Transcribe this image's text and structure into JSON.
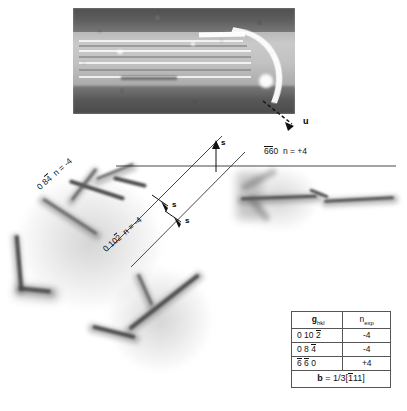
{
  "figure": {
    "micrograph": {
      "name": "tem-micrograph-fringes",
      "fringe_count": 7
    },
    "direction_label": "u",
    "diffraction_labels": [
      {
        "id": "g-084",
        "h": "0",
        "k": "8",
        "l": "4",
        "l_bar": true,
        "n_text": "n = -4",
        "full": "0 8 4̄  n = -4"
      },
      {
        "id": "g-0102",
        "h": "0",
        "k": "10",
        "l": "2",
        "l_bar": true,
        "n_text": "n = -4",
        "full": "0 10 2̄  n = -4"
      },
      {
        "id": "g-660",
        "h": "6",
        "k": "6",
        "l": "0",
        "h_bar": true,
        "k_bar": true,
        "n_text": "n = +4",
        "full": "6̄6̄0  n = +4"
      }
    ],
    "s_markers": [
      {
        "id": "s-up",
        "label": "s",
        "direction": "up"
      },
      {
        "id": "s-down-1",
        "label": "s",
        "direction": "down"
      },
      {
        "id": "s-down-2",
        "label": "s",
        "direction": "down"
      }
    ]
  },
  "table": {
    "name": "diffraction-vector-table",
    "headers": {
      "col1_main": "g",
      "col1_sub": "hkl",
      "col2_main": "n",
      "col2_sub": "exp"
    },
    "rows": [
      {
        "g": "0 10 2",
        "g_display": "0 10 2̄",
        "n": "-4"
      },
      {
        "g": "0 8 4",
        "g_display": "0 8 4̄",
        "n": "-4"
      },
      {
        "g": "6 6 0",
        "g_display": "6̄ 6̄ 0",
        "n": "+4"
      }
    ],
    "footer": {
      "symbol": "b",
      "equals": "=",
      "value": "1/3[111]",
      "value_display": "1/3[1̄11]"
    }
  },
  "colors": {
    "ink": "#111111",
    "rule": "#555555",
    "dislocation": "#5c5c5c",
    "background": "#ffffff"
  }
}
